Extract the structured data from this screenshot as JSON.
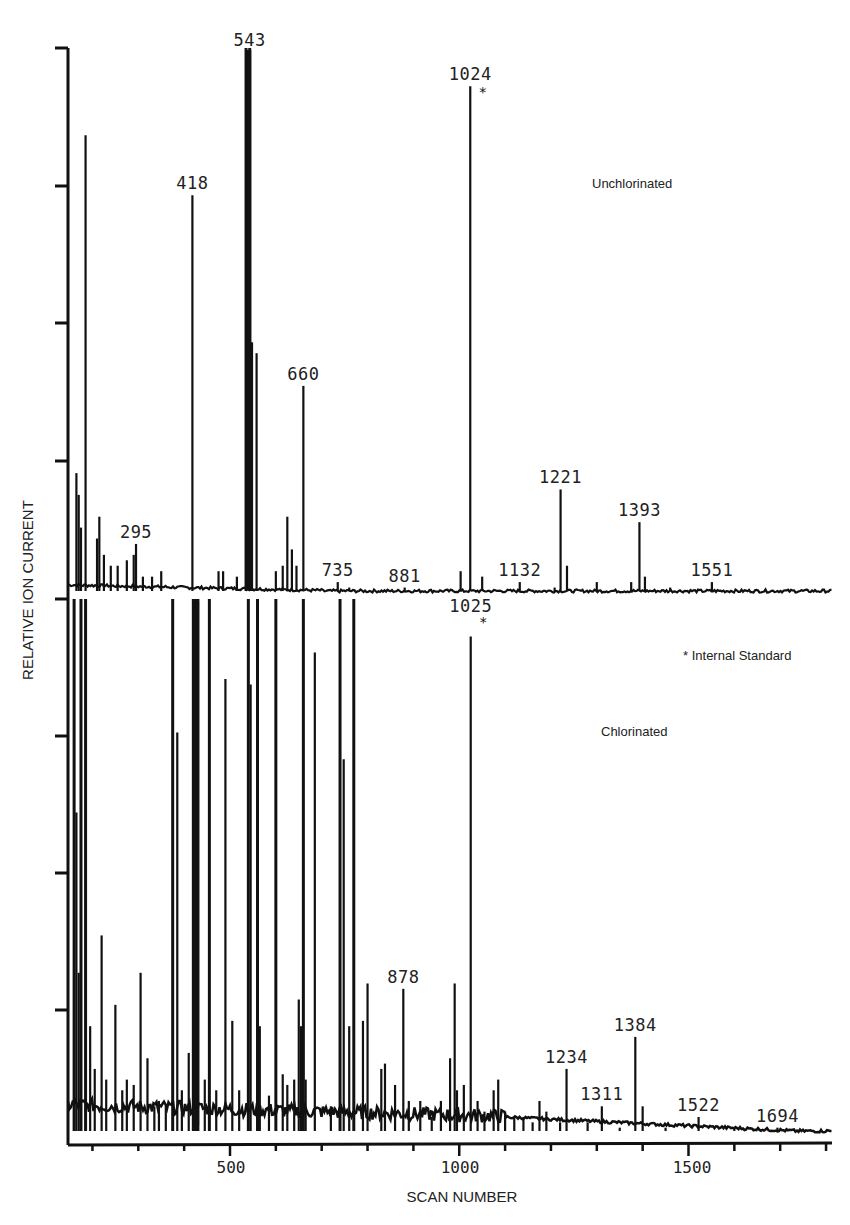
{
  "chart_data": {
    "type": "line",
    "title": "",
    "xlabel": "SCAN NUMBER",
    "ylabel": "RELATIVE ION CURRENT",
    "xlim": [
      155,
      1800
    ],
    "x_ticks": [
      500,
      1000,
      1500
    ],
    "x_minor_tick_step": 100,
    "y_ticks_per_panel": 4,
    "grid": false,
    "legend": {
      "text": "* Internal Standard",
      "position": "right-middle"
    },
    "series": [
      {
        "name": "Unchlorinated",
        "panel": "upper",
        "peaks": [
          {
            "scan": 165,
            "height": 22
          },
          {
            "scan": 170,
            "height": 18
          },
          {
            "scan": 175,
            "height": 12
          },
          {
            "scan": 185,
            "height": 84
          },
          {
            "scan": 210,
            "height": 10
          },
          {
            "scan": 215,
            "height": 14
          },
          {
            "scan": 225,
            "height": 7
          },
          {
            "scan": 240,
            "height": 5
          },
          {
            "scan": 255,
            "height": 5
          },
          {
            "scan": 275,
            "height": 6
          },
          {
            "scan": 290,
            "height": 7
          },
          {
            "scan": 295,
            "height": 9,
            "label": "295"
          },
          {
            "scan": 310,
            "height": 3
          },
          {
            "scan": 330,
            "height": 3
          },
          {
            "scan": 350,
            "height": 4
          },
          {
            "scan": 418,
            "height": 73,
            "label": "418"
          },
          {
            "scan": 475,
            "height": 4
          },
          {
            "scan": 485,
            "height": 4
          },
          {
            "scan": 515,
            "height": 3
          },
          {
            "scan": 535,
            "height": 100
          },
          {
            "scan": 543,
            "height": 100,
            "label": "543"
          },
          {
            "scan": 548,
            "height": 46
          },
          {
            "scan": 558,
            "height": 44
          },
          {
            "scan": 600,
            "height": 4
          },
          {
            "scan": 615,
            "height": 5
          },
          {
            "scan": 625,
            "height": 14
          },
          {
            "scan": 635,
            "height": 8
          },
          {
            "scan": 645,
            "height": 5
          },
          {
            "scan": 660,
            "height": 38,
            "label": "660"
          },
          {
            "scan": 735,
            "height": 2,
            "label": "735"
          },
          {
            "scan": 760,
            "height": 1
          },
          {
            "scan": 881,
            "height": 1,
            "label": "881"
          },
          {
            "scan": 1003,
            "height": 4
          },
          {
            "scan": 1024,
            "height": 93,
            "label": "1024",
            "internal_standard": true
          },
          {
            "scan": 1050,
            "height": 3
          },
          {
            "scan": 1132,
            "height": 2,
            "label": "1132"
          },
          {
            "scan": 1208,
            "height": 1
          },
          {
            "scan": 1221,
            "height": 19,
            "label": "1221"
          },
          {
            "scan": 1235,
            "height": 5
          },
          {
            "scan": 1300,
            "height": 2
          },
          {
            "scan": 1375,
            "height": 2
          },
          {
            "scan": 1393,
            "height": 13,
            "label": "1393"
          },
          {
            "scan": 1405,
            "height": 3
          },
          {
            "scan": 1460,
            "height": 1
          },
          {
            "scan": 1551,
            "height": 2,
            "label": "1551"
          }
        ]
      },
      {
        "name": "Chlorinated",
        "panel": "lower",
        "peaks": [
          {
            "scan": 160,
            "height": 100
          },
          {
            "scan": 165,
            "height": 60
          },
          {
            "scan": 170,
            "height": 30
          },
          {
            "scan": 175,
            "height": 100
          },
          {
            "scan": 185,
            "height": 100
          },
          {
            "scan": 195,
            "height": 20
          },
          {
            "scan": 205,
            "height": 12
          },
          {
            "scan": 220,
            "height": 37
          },
          {
            "scan": 230,
            "height": 10
          },
          {
            "scan": 250,
            "height": 24
          },
          {
            "scan": 265,
            "height": 8
          },
          {
            "scan": 275,
            "height": 10
          },
          {
            "scan": 290,
            "height": 9
          },
          {
            "scan": 305,
            "height": 30
          },
          {
            "scan": 320,
            "height": 14
          },
          {
            "scan": 335,
            "height": 5
          },
          {
            "scan": 345,
            "height": 6
          },
          {
            "scan": 360,
            "height": 5
          },
          {
            "scan": 375,
            "height": 100
          },
          {
            "scan": 385,
            "height": 75
          },
          {
            "scan": 395,
            "height": 8
          },
          {
            "scan": 410,
            "height": 15
          },
          {
            "scan": 420,
            "height": 100
          },
          {
            "scan": 425,
            "height": 100
          },
          {
            "scan": 430,
            "height": 100
          },
          {
            "scan": 445,
            "height": 10
          },
          {
            "scan": 455,
            "height": 100
          },
          {
            "scan": 470,
            "height": 8
          },
          {
            "scan": 490,
            "height": 85
          },
          {
            "scan": 505,
            "height": 21
          },
          {
            "scan": 520,
            "height": 8
          },
          {
            "scan": 540,
            "height": 100
          },
          {
            "scan": 545,
            "height": 84
          },
          {
            "scan": 560,
            "height": 100
          },
          {
            "scan": 565,
            "height": 20
          },
          {
            "scan": 585,
            "height": 7
          },
          {
            "scan": 600,
            "height": 100
          },
          {
            "scan": 615,
            "height": 11
          },
          {
            "scan": 625,
            "height": 9
          },
          {
            "scan": 640,
            "height": 10
          },
          {
            "scan": 650,
            "height": 25
          },
          {
            "scan": 655,
            "height": 20
          },
          {
            "scan": 660,
            "height": 100
          },
          {
            "scan": 665,
            "height": 10
          },
          {
            "scan": 685,
            "height": 90
          },
          {
            "scan": 720,
            "height": 5
          },
          {
            "scan": 740,
            "height": 100
          },
          {
            "scan": 748,
            "height": 70
          },
          {
            "scan": 760,
            "height": 20
          },
          {
            "scan": 770,
            "height": 100
          },
          {
            "scan": 790,
            "height": 21
          },
          {
            "scan": 800,
            "height": 28
          },
          {
            "scan": 830,
            "height": 12
          },
          {
            "scan": 838,
            "height": 13
          },
          {
            "scan": 860,
            "height": 9
          },
          {
            "scan": 878,
            "height": 27,
            "label": "878"
          },
          {
            "scan": 890,
            "height": 6
          },
          {
            "scan": 915,
            "height": 6
          },
          {
            "scan": 940,
            "height": 3
          },
          {
            "scan": 960,
            "height": 6
          },
          {
            "scan": 980,
            "height": 14
          },
          {
            "scan": 990,
            "height": 28
          },
          {
            "scan": 995,
            "height": 8
          },
          {
            "scan": 1010,
            "height": 9
          },
          {
            "scan": 1025,
            "height": 93,
            "label": "1025",
            "internal_standard": true
          },
          {
            "scan": 1040,
            "height": 6
          },
          {
            "scan": 1055,
            "height": 4
          },
          {
            "scan": 1075,
            "height": 8
          },
          {
            "scan": 1085,
            "height": 10
          },
          {
            "scan": 1100,
            "height": 4
          },
          {
            "scan": 1120,
            "height": 3
          },
          {
            "scan": 1140,
            "height": 3
          },
          {
            "scan": 1160,
            "height": 2
          },
          {
            "scan": 1175,
            "height": 6
          },
          {
            "scan": 1190,
            "height": 4
          },
          {
            "scan": 1220,
            "height": 2
          },
          {
            "scan": 1234,
            "height": 12,
            "label": "1234"
          },
          {
            "scan": 1280,
            "height": 2
          },
          {
            "scan": 1311,
            "height": 5,
            "label": "1311"
          },
          {
            "scan": 1350,
            "height": 1
          },
          {
            "scan": 1384,
            "height": 18,
            "label": "1384"
          },
          {
            "scan": 1400,
            "height": 5
          },
          {
            "scan": 1450,
            "height": 1
          },
          {
            "scan": 1522,
            "height": 3,
            "label": "1522"
          },
          {
            "scan": 1600,
            "height": 1
          },
          {
            "scan": 1694,
            "height": 1,
            "label": "1694"
          }
        ]
      }
    ],
    "annotations": [
      "Unchlorinated",
      "Chlorinated",
      "* Internal Standard"
    ]
  },
  "labels": {
    "xlabel": "SCAN NUMBER",
    "ylabel": "RELATIVE ION CURRENT",
    "upper_panel": "Unchlorinated",
    "lower_panel": "Chlorinated",
    "legend": "Internal Standard",
    "star": "*",
    "x_ticks": [
      "500",
      "1000",
      "1500"
    ]
  },
  "colors": {
    "ink": "#111111",
    "background": "#ffffff"
  }
}
